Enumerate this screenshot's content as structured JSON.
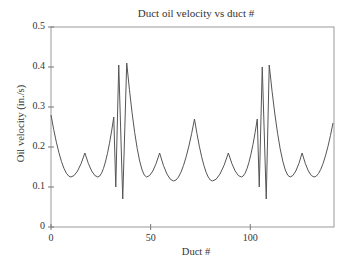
{
  "chart_data": {
    "type": "line",
    "title": "Duct oil velocity vs duct #",
    "xlabel": "Duct #",
    "ylabel": "Oil velocity (in./s)",
    "xlim": [
      0,
      142
    ],
    "ylim": [
      0,
      0.5
    ],
    "xticks": [
      "0",
      "50",
      "100"
    ],
    "yticks": [
      "0",
      "0.1",
      "0.2",
      "0.3",
      "0.4",
      "0.5"
    ],
    "grid": false,
    "series": [
      {
        "name": "Oil velocity",
        "x": [
          0,
          10,
          17,
          23.5,
          31.5,
          32.5,
          34,
          36,
          38,
          48,
          54.5,
          61.5,
          72,
          81,
          89,
          95.5,
          103.5,
          104.5,
          106,
          108,
          109.5,
          120,
          126,
          132,
          141.5
        ],
        "y": [
          0.28,
          0.125,
          0.185,
          0.125,
          0.275,
          0.1,
          0.405,
          0.07,
          0.41,
          0.125,
          0.185,
          0.115,
          0.27,
          0.115,
          0.185,
          0.125,
          0.27,
          0.1,
          0.4,
          0.07,
          0.405,
          0.125,
          0.185,
          0.125,
          0.26
        ]
      }
    ]
  }
}
